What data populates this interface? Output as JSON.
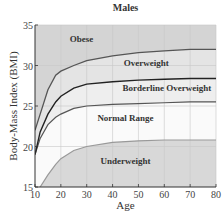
{
  "chart_data": {
    "type": "area",
    "title": "Males",
    "xlabel": "Age",
    "ylabel": "Body-Mass Index (BMI)",
    "xlim": [
      10,
      80
    ],
    "ylim": [
      15,
      35
    ],
    "x_ticks": [
      10,
      20,
      30,
      40,
      50,
      60,
      70,
      80
    ],
    "y_ticks": [
      15,
      20,
      25,
      30,
      35
    ],
    "grid": true,
    "x": [
      10,
      12,
      15,
      18,
      20,
      25,
      30,
      40,
      50,
      60,
      70,
      80
    ],
    "series": [
      {
        "name": "Underweight / Normal boundary",
        "values": [
          14.5,
          15.0,
          16.5,
          17.8,
          18.5,
          19.5,
          20.0,
          20.5,
          20.7,
          20.8,
          20.8,
          20.8
        ]
      },
      {
        "name": "Normal / Borderline Overweight boundary",
        "values": [
          19.0,
          21.0,
          22.7,
          23.6,
          24.0,
          24.7,
          25.0,
          25.2,
          25.3,
          25.4,
          25.5,
          25.5
        ]
      },
      {
        "name": "Borderline Overweight / Overweight boundary",
        "values": [
          19.0,
          21.8,
          24.0,
          25.5,
          26.2,
          27.2,
          27.7,
          28.0,
          28.2,
          28.3,
          28.4,
          28.4
        ]
      },
      {
        "name": "Overweight / Obese boundary",
        "values": [
          22.0,
          24.0,
          27.0,
          28.8,
          29.3,
          30.0,
          30.6,
          31.2,
          31.6,
          31.8,
          32.0,
          32.0
        ]
      }
    ],
    "regions": [
      {
        "label": "Obese",
        "label_x": 28,
        "label_y": 32.9
      },
      {
        "label": "Overweight",
        "label_x": 53,
        "label_y": 29.9
      },
      {
        "label": "Borderline Overweight",
        "label_x": 61,
        "label_y": 26.8
      },
      {
        "label": "Normal Range",
        "label_x": 45,
        "label_y": 23.2
      },
      {
        "label": "Underweight",
        "label_x": 45,
        "label_y": 17.8
      }
    ],
    "colors": {
      "obese_fill": "#d4d4d4",
      "overweight_fill": "#e4e4e4",
      "borderline_fill": "#eeeeee",
      "normal_fill": "#fafafa",
      "underweight_fill": "#d8d8d8",
      "curve_upper": "#555555",
      "curve_dark": "#222222",
      "curve_light": "#999999"
    }
  }
}
